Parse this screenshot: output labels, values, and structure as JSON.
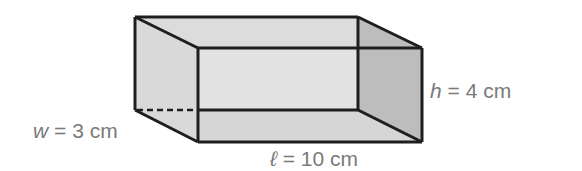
{
  "diagram": {
    "type": "rectangular-prism",
    "colors": {
      "edge": "#1e1e1e",
      "top_face": "#dcdcdc",
      "front_face": "#e2e2e2",
      "left_face": "#d9d9d9",
      "right_face": "#bdbdbd",
      "bottom_face": "#d4d4d4",
      "label": "#7a7a7a"
    },
    "labels": {
      "width": {
        "var": "w",
        "eq": "=",
        "value": "3",
        "unit": "cm"
      },
      "length": {
        "var": "ℓ",
        "eq": "=",
        "value": "10",
        "unit": "cm"
      },
      "height": {
        "var": "h",
        "eq": "=",
        "value": "4",
        "unit": "cm"
      }
    }
  }
}
